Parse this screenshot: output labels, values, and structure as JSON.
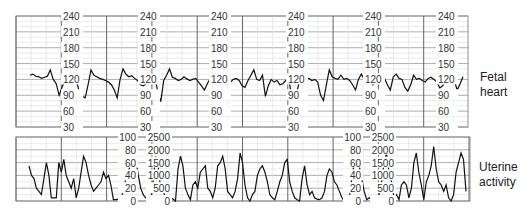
{
  "chart_data": [
    {
      "type": "line",
      "title": "Fetal heart",
      "ylabel": "Fetal heart rate (bpm)",
      "yticks": [
        30,
        60,
        90,
        120,
        150,
        180,
        210,
        240
      ],
      "ylim": [
        30,
        240
      ],
      "grid": true,
      "axis_label_columns": 6,
      "series": [
        {
          "name": "Fetal heart",
          "baseline": 120,
          "values": [
            128,
            130,
            126,
            125,
            122,
            124,
            126,
            138,
            120,
            112,
            90,
            105,
            118,
            125,
            122,
            120,
            118,
            95,
            88,
            85,
            110,
            138,
            128,
            125,
            122,
            120,
            118,
            115,
            110,
            100,
            85,
            120,
            140,
            130,
            125,
            127,
            122,
            118,
            110,
            108,
            112,
            120,
            122,
            125,
            95,
            78,
            118,
            128,
            140,
            124,
            122,
            118,
            120,
            125,
            121,
            118,
            120,
            122,
            115,
            108,
            100,
            112,
            122,
            120,
            118,
            122,
            124,
            122,
            120,
            115,
            120,
            122,
            118,
            108,
            105,
            118,
            128,
            138,
            120,
            118,
            128,
            88,
            108,
            120,
            115,
            118,
            110,
            112,
            118,
            125,
            88,
            85,
            100,
            125,
            122,
            120,
            122,
            118,
            120,
            115,
            90,
            80,
            110,
            138,
            125,
            122,
            120,
            128,
            120,
            122,
            118,
            110,
            100,
            120,
            130,
            120,
            125,
            118,
            110,
            122,
            120,
            118,
            122,
            110,
            100,
            125,
            130,
            122,
            120,
            105,
            98,
            110,
            128,
            120,
            122,
            118,
            115,
            122,
            124,
            120,
            115,
            104,
            108,
            120,
            125,
            122,
            118,
            100,
            112,
            125
          ]
        }
      ]
    },
    {
      "type": "line",
      "title": "Uterine activity",
      "ylabel": "Uterine activity",
      "yticks_left": [
        0,
        20,
        40,
        60,
        80,
        100
      ],
      "yticks_right": [
        0,
        500,
        1000,
        1500,
        2000,
        2500
      ],
      "ylim_left": [
        0,
        100
      ],
      "ylim_right": [
        0,
        2500
      ],
      "grid": true,
      "series": [
        {
          "name": "Uterine activity",
          "values": [
            55,
            40,
            35,
            20,
            15,
            10,
            35,
            60,
            40,
            5,
            5,
            5,
            60,
            45,
            65,
            40,
            30,
            20,
            35,
            5,
            20,
            45,
            70,
            60,
            40,
            25,
            15,
            20,
            25,
            30,
            45,
            35,
            40,
            25,
            2,
            2,
            3,
            5,
            15,
            35,
            45,
            60,
            55,
            65,
            40,
            20,
            10,
            5,
            2,
            0,
            30,
            70,
            55,
            20,
            15,
            5,
            2,
            5,
            3,
            0,
            50,
            70,
            55,
            20,
            10,
            2,
            25,
            30,
            20,
            45,
            50,
            55,
            20,
            15,
            5,
            20,
            55,
            60,
            70,
            50,
            15,
            10,
            5,
            15,
            35,
            75,
            60,
            25,
            5,
            0,
            10,
            15,
            40,
            50,
            55,
            45,
            30,
            10,
            5,
            2,
            15,
            30,
            40,
            60,
            65,
            30,
            15,
            5,
            2,
            0,
            35,
            55,
            25,
            10,
            15,
            5,
            3,
            2,
            5,
            15,
            40,
            50,
            45,
            30,
            25,
            15,
            5,
            0,
            0,
            5,
            35,
            60,
            65,
            55,
            35,
            15,
            2,
            5,
            2,
            3,
            0,
            10,
            30,
            60,
            75,
            45,
            30,
            5,
            10,
            2,
            25,
            30,
            25,
            5,
            20,
            60,
            75,
            45,
            25,
            2,
            30,
            40,
            55,
            85,
            50,
            30,
            25,
            15,
            25,
            5,
            0,
            10,
            45,
            60,
            75,
            65,
            15
          ]
        }
      ]
    }
  ],
  "labels": {
    "fetal_heart": "Fetal heart",
    "uterine_line1": "Uterine",
    "uterine_line2": "activity"
  },
  "heart_ticks": [
    "240",
    "210",
    "180",
    "150",
    "120",
    "90",
    "60",
    "30"
  ],
  "ua_left_ticks": [
    "100",
    "80",
    "60",
    "40",
    "20",
    "0"
  ],
  "ua_right_ticks": [
    "2500",
    "2000",
    "1500",
    "1000",
    "500",
    "0"
  ]
}
